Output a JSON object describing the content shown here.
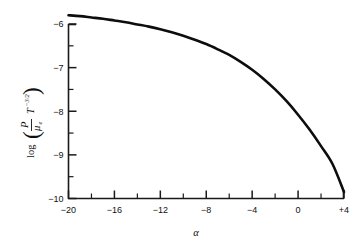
{
  "figure": {
    "background_color": "#ffffff",
    "curve_color": "#0d0d0d",
    "axis_color": "#1a1a1a"
  },
  "axes": {
    "x": {
      "label": "α",
      "min": -20,
      "max": 4,
      "major_ticks": [
        -20,
        -16,
        -12,
        -8,
        -4,
        0,
        4
      ],
      "major_tick_labels": [
        "−20",
        "−16",
        "−12",
        "−8",
        "−4",
        "0",
        "+4"
      ],
      "minor_ticks": [
        -18,
        -14,
        -10,
        -6,
        -2,
        2
      ]
    },
    "y": {
      "label_parts": {
        "log": "log",
        "open_paren": "(",
        "numerator": "P",
        "denominator": "μ",
        "denominator_sub": "e",
        "times_var": "T",
        "exponent": "−3/2",
        "close_paren": ")"
      },
      "label_plain": "log( P/μ_e · T^−3/2 )",
      "min": -10,
      "max": -6,
      "major_ticks": [
        -10,
        -9,
        -8,
        -7,
        -6
      ],
      "major_tick_labels": [
        "−10",
        "−9",
        "−8",
        "−7",
        "−6"
      ],
      "minor_ticks": [
        -9.5,
        -8.5,
        -7.5,
        -6.5
      ]
    }
  },
  "chart_data": {
    "type": "line",
    "title": "",
    "subtitle": "",
    "xlabel": "α",
    "ylabel": "log( P/μ_e · T^−3/2 )",
    "xlim": [
      -20,
      4
    ],
    "ylim": [
      -10,
      -6
    ],
    "grid": false,
    "legend": null,
    "xtick_labels": [
      "−20",
      "−16",
      "−12",
      "−8",
      "−4",
      "0",
      "+4"
    ],
    "ytick_labels": [
      "−10",
      "−9",
      "−8",
      "−7",
      "−6"
    ],
    "annotations": [],
    "series": [
      {
        "name": "log(P/μ_e T^-3/2) vs α",
        "x": [
          -20,
          -19,
          -18,
          -17,
          -16,
          -15,
          -14,
          -13,
          -12,
          -11,
          -10,
          -9,
          -8,
          -7,
          -6,
          -5,
          -4,
          -3,
          -2,
          -1,
          0,
          1,
          2,
          3,
          4
        ],
        "y": [
          -5.8,
          -5.82,
          -5.85,
          -5.88,
          -5.92,
          -5.96,
          -6.01,
          -6.06,
          -6.12,
          -6.19,
          -6.27,
          -6.36,
          -6.46,
          -6.58,
          -6.71,
          -6.87,
          -7.05,
          -7.26,
          -7.5,
          -7.77,
          -8.08,
          -8.42,
          -8.8,
          -9.21,
          -9.85
        ]
      }
    ]
  }
}
